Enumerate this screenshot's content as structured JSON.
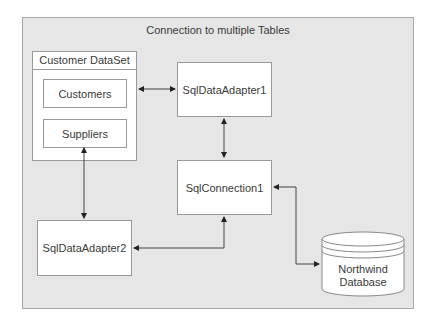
{
  "diagram": {
    "title": "Connection to multiple Tables",
    "dataset": {
      "label": "Customer DataSet",
      "tables": [
        "Customers",
        "Suppliers"
      ]
    },
    "nodes": {
      "adapter1": "SqlDataAdapter1",
      "connection": "SqlConnection1",
      "adapter2": "SqlDataAdapter2",
      "database_line1": "Northwind",
      "database_line2": "Database"
    },
    "connections": [
      {
        "from": "Customer DataSet",
        "to": "SqlDataAdapter1",
        "direction": "bidirectional"
      },
      {
        "from": "SqlDataAdapter1",
        "to": "SqlConnection1",
        "direction": "bidirectional"
      },
      {
        "from": "Customer DataSet",
        "to": "SqlDataAdapter2",
        "direction": "bidirectional"
      },
      {
        "from": "SqlDataAdapter2",
        "to": "SqlConnection1",
        "direction": "bidirectional"
      },
      {
        "from": "SqlConnection1",
        "to": "Northwind Database",
        "direction": "bidirectional"
      }
    ]
  }
}
